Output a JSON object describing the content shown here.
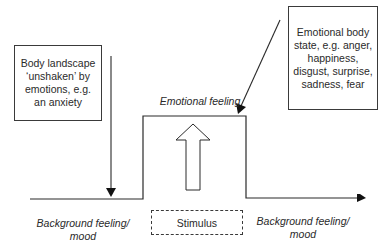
{
  "diagram": {
    "left_box": "Body landscape ‘unshaken’ by emotions, e.g. an anxiety",
    "right_box": "Emotional body state, e.g. anger, happiness, disgust, surprise, sadness, fear",
    "peak_label": "Emotional feeling",
    "left_baseline_label": "Background feeling/ mood",
    "right_baseline_label": "Background feeling/ mood",
    "stimulus_label": "Stimulus"
  }
}
